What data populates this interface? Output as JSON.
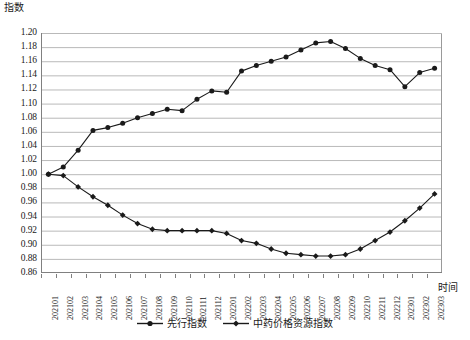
{
  "axis": {
    "y_title": "指数",
    "x_title": "时间"
  },
  "legend": {
    "items": [
      {
        "label": "先行指数",
        "marker": "round-dot-line",
        "color": "#1a1a1a"
      },
      {
        "label": "中药价格资源指数",
        "marker": "diamond-dot-line",
        "color": "#1a1a1a"
      }
    ]
  },
  "chart_data": {
    "type": "line",
    "title": "",
    "subtitle": "",
    "xlabel": "时间",
    "ylabel": "指数",
    "ylim": [
      0.86,
      1.2
    ],
    "ytick_step": 0.02,
    "yticks": [
      "1.20",
      "1.18",
      "1.16",
      "1.14",
      "1.12",
      "1.10",
      "1.08",
      "1.06",
      "1.04",
      "1.02",
      "1.00",
      "0.98",
      "0.96",
      "0.94",
      "0.92",
      "0.90",
      "0.88",
      "0.86"
    ],
    "grid": true,
    "grid_axis": "y",
    "legend_position": "bottom-center",
    "categories": [
      "202101",
      "202102",
      "202103",
      "202104",
      "202105",
      "202106",
      "202107",
      "202108",
      "202109",
      "202110",
      "202111",
      "202112",
      "202201",
      "202202",
      "202203",
      "202204",
      "202205",
      "202206",
      "202207",
      "202208",
      "202209",
      "202210",
      "202211",
      "202212",
      "202301",
      "202302",
      "202303"
    ],
    "series": [
      {
        "name": "先行指数",
        "color": "#1a1a1a",
        "marker": "circle",
        "values": [
          1.0,
          1.01,
          1.034,
          1.062,
          1.066,
          1.072,
          1.08,
          1.086,
          1.092,
          1.09,
          1.106,
          1.118,
          1.116,
          1.146,
          1.154,
          1.16,
          1.166,
          1.176,
          1.186,
          1.188,
          1.178,
          1.164,
          1.154,
          1.148,
          1.124,
          1.144,
          1.15
        ]
      },
      {
        "name": "中药价格资源指数",
        "color": "#1a1a1a",
        "marker": "diamond",
        "values": [
          1.0,
          0.998,
          0.982,
          0.968,
          0.956,
          0.942,
          0.93,
          0.922,
          0.92,
          0.92,
          0.92,
          0.92,
          0.916,
          0.906,
          0.902,
          0.894,
          0.888,
          0.886,
          0.884,
          0.884,
          0.886,
          0.894,
          0.906,
          0.918,
          0.934,
          0.952,
          0.972
        ]
      }
    ]
  }
}
